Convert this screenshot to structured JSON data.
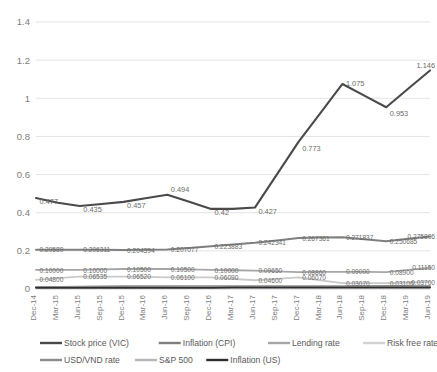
{
  "chart_data": {
    "type": "line",
    "title": "",
    "xlabel": "",
    "ylabel": "",
    "ylim": [
      0,
      1.4
    ],
    "yticks": [
      "0",
      "0.2",
      "0.4",
      "0.6",
      "0.8",
      "1",
      "1.2",
      "1.4"
    ],
    "ytick_values": [
      0,
      0.2,
      0.4,
      0.6,
      0.8,
      1.0,
      1.2,
      1.4
    ],
    "grid": true,
    "legend_position": "bottom",
    "categories": [
      "Dec-14",
      "Mar-15",
      "Jun-15",
      "Sep-15",
      "Dec-15",
      "Mar-16",
      "Jun-16",
      "Sep-16",
      "Dec-16",
      "Mar-17",
      "Jun-17",
      "Sep-17",
      "Dec-17",
      "Mar-18",
      "Jun-18",
      "Sep-18",
      "Dec-18",
      "Mar-19",
      "Jun-19"
    ],
    "series": [
      {
        "name": "Stock price (VIC)",
        "color": "#4a4a4a",
        "width": 2.1,
        "values": [
          0.477,
          0.452,
          0.435,
          0.446,
          0.457,
          0.476,
          0.494,
          0.457,
          0.42,
          0.42,
          0.427,
          0.6,
          0.773,
          0.924,
          1.075,
          1.014,
          0.953,
          1.05,
          1.146
        ],
        "labels": [
          {
            "index": 0,
            "text": "0.477"
          },
          {
            "index": 2,
            "text": "0.435"
          },
          {
            "index": 4,
            "text": "0.457"
          },
          {
            "index": 6,
            "text": "0.494"
          },
          {
            "index": 8,
            "text": "0.42"
          },
          {
            "index": 10,
            "text": "0.427"
          },
          {
            "index": 12,
            "text": "0.773"
          },
          {
            "index": 14,
            "text": "1.075"
          },
          {
            "index": 16,
            "text": "0.953"
          },
          {
            "index": 18,
            "text": "1.146"
          }
        ]
      },
      {
        "name": "Inflation (CPI)",
        "color": "#7f7f7f",
        "width": 2.0,
        "values": [
          0.20589,
          0.2061,
          0.206311,
          0.205352,
          0.204394,
          0.205736,
          0.207077,
          0.21548,
          0.223883,
          0.233112,
          0.242341,
          0.254851,
          0.267361,
          0.269599,
          0.271837,
          0.261261,
          0.250685,
          0.263246,
          0.275806
        ],
        "labels": [
          {
            "index": 0,
            "text": "0.20589"
          },
          {
            "index": 2,
            "text": "0.206311"
          },
          {
            "index": 4,
            "text": "0.204394"
          },
          {
            "index": 6,
            "text": "0.207077"
          },
          {
            "index": 8,
            "text": "0.223883"
          },
          {
            "index": 10,
            "text": "0.242341"
          },
          {
            "index": 12,
            "text": "0.267361"
          },
          {
            "index": 14,
            "text": "0.271837"
          },
          {
            "index": 16,
            "text": "0.250685"
          },
          {
            "index": 18,
            "text": "0.275806"
          }
        ]
      },
      {
        "name": "Lending rate",
        "color": "#a6a6a6",
        "width": 1.8,
        "values": [
          0.1,
          0.1,
          0.1,
          0.1025,
          0.105,
          0.105,
          0.105,
          0.1025,
          0.1,
          0.09825,
          0.0965,
          0.09255,
          0.0886,
          0.0893,
          0.09,
          0.0895,
          0.089,
          0.10025,
          0.1115
        ],
        "labels": [
          {
            "index": 0,
            "text": "0.10000"
          },
          {
            "index": 2,
            "text": "0.10000"
          },
          {
            "index": 4,
            "text": "0.10500"
          },
          {
            "index": 6,
            "text": "0.10500"
          },
          {
            "index": 8,
            "text": "0.10000"
          },
          {
            "index": 10,
            "text": "0.09650"
          },
          {
            "index": 12,
            "text": "0.08860"
          },
          {
            "index": 14,
            "text": "0.09000"
          },
          {
            "index": 16,
            "text": "0.08900"
          },
          {
            "index": 18,
            "text": "0.11150"
          }
        ]
      },
      {
        "name": "Risk free rate",
        "color": "#c9c9c9",
        "width": 1.8,
        "values": [
          0.048,
          0.05668,
          0.06535,
          0.06528,
          0.0652,
          0.0631,
          0.061,
          0.06095,
          0.0609,
          0.05345,
          0.046,
          0.05335,
          0.0607,
          0.0457,
          0.0307,
          0.03085,
          0.031,
          0.034,
          0.037
        ],
        "labels": [
          {
            "index": 0,
            "text": "0.04800"
          },
          {
            "index": 2,
            "text": "0.06535"
          },
          {
            "index": 4,
            "text": "0.06520"
          },
          {
            "index": 6,
            "text": "0.06100"
          },
          {
            "index": 8,
            "text": "0.06090"
          },
          {
            "index": 10,
            "text": "0.04600"
          },
          {
            "index": 12,
            "text": "0.06070"
          },
          {
            "index": 14,
            "text": "0.03070"
          },
          {
            "index": 16,
            "text": "0.03100"
          },
          {
            "index": 18,
            "text": "0.03700"
          }
        ]
      },
      {
        "name": "USD/VND rate",
        "color": "#8c8c8c",
        "width": 1.6,
        "values": [
          0.012,
          0.012,
          0.013,
          0.014,
          0.015,
          0.015,
          0.015,
          0.015,
          0.015,
          0.015,
          0.015,
          0.015,
          0.016,
          0.016,
          0.016,
          0.017,
          0.017,
          0.017,
          0.017
        ]
      },
      {
        "name": "S&P 500",
        "color": "#b5b5b5",
        "width": 1.6,
        "values": [
          0.01,
          0.01,
          0.01,
          0.009,
          0.009,
          0.01,
          0.01,
          0.011,
          0.011,
          0.012,
          0.012,
          0.012,
          0.013,
          0.013,
          0.013,
          0.013,
          0.012,
          0.013,
          0.013
        ]
      },
      {
        "name": "Inflation (US)",
        "color": "#2e2e2e",
        "width": 2.0,
        "values": [
          0.006,
          0.006,
          0.006,
          0.006,
          0.006,
          0.007,
          0.007,
          0.007,
          0.007,
          0.008,
          0.008,
          0.008,
          0.008,
          0.008,
          0.008,
          0.008,
          0.008,
          0.008,
          0.008
        ]
      }
    ]
  },
  "legend": {
    "row1": [
      {
        "label": "Stock price (VIC)",
        "color": "#4a4a4a"
      },
      {
        "label": "Inflation (CPI)",
        "color": "#7f7f7f"
      },
      {
        "label": "Lending rate",
        "color": "#a6a6a6"
      },
      {
        "label": "Risk free rate",
        "color": "#d2d2d2"
      }
    ],
    "row2": [
      {
        "label": "USD/VND rate",
        "color": "#8c8c8c"
      },
      {
        "label": "S&P 500",
        "color": "#b5b5b5"
      },
      {
        "label": "Inflation (US)",
        "color": "#2e2e2e"
      }
    ]
  }
}
